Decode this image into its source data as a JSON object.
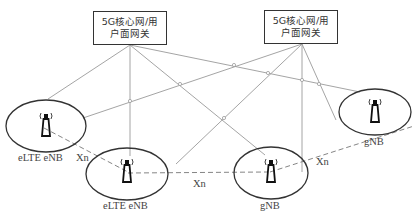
{
  "gateways": [
    {
      "id": "gw1",
      "line1": "5G核心网/用",
      "line2": "户面网关"
    },
    {
      "id": "gw2",
      "line1": "5G核心网/用",
      "line2": "户面网关"
    }
  ],
  "nodes": [
    {
      "id": "enb1",
      "label": "eLTE eNB"
    },
    {
      "id": "enb2",
      "label": "eLTE eNB"
    },
    {
      "id": "gnb1",
      "label": "gNB"
    },
    {
      "id": "gnb2",
      "label": "gNB"
    }
  ],
  "interfaces": [
    {
      "id": "xn1",
      "label": "Xn"
    },
    {
      "id": "xn2",
      "label": "Xn"
    },
    {
      "id": "xn3",
      "label": "Xn"
    }
  ],
  "colors": {
    "line": "#9a9a9a",
    "outline": "#333333",
    "text": "#444444"
  }
}
